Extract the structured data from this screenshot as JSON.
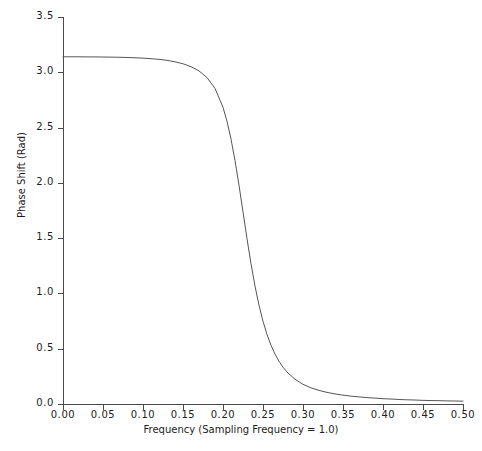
{
  "chart_data": {
    "type": "line",
    "title": "",
    "xlabel": "Frequency (Sampling Frequency = 1.0)",
    "ylabel": "Phase Shift (Rad)",
    "xlim": [
      0.0,
      0.5
    ],
    "ylim": [
      0.0,
      3.5
    ],
    "grid": false,
    "legend": "none",
    "xticks": [
      "0.00",
      "0.05",
      "0.10",
      "0.15",
      "0.20",
      "0.25",
      "0.30",
      "0.35",
      "0.40",
      "0.45",
      "0.50"
    ],
    "xtick_values": [
      0.0,
      0.05,
      0.1,
      0.15,
      0.2,
      0.25,
      0.3,
      0.35,
      0.4,
      0.45,
      0.5
    ],
    "yticks": [
      "0.0",
      "0.5",
      "1.0",
      "1.5",
      "2.0",
      "2.5",
      "3.0",
      "3.5"
    ],
    "ytick_values": [
      0.0,
      0.5,
      1.0,
      1.5,
      2.0,
      2.5,
      3.0,
      3.5
    ],
    "series": [
      {
        "name": "Phase Shift",
        "color": "#555555",
        "linewidth": 1,
        "x": [
          0.0,
          0.01,
          0.02,
          0.03,
          0.04,
          0.05,
          0.06,
          0.07,
          0.08,
          0.09,
          0.1,
          0.11,
          0.12,
          0.13,
          0.14,
          0.15,
          0.16,
          0.17,
          0.18,
          0.19,
          0.2,
          0.205,
          0.21,
          0.215,
          0.22,
          0.225,
          0.23,
          0.235,
          0.24,
          0.245,
          0.25,
          0.255,
          0.26,
          0.265,
          0.27,
          0.275,
          0.28,
          0.29,
          0.3,
          0.31,
          0.32,
          0.33,
          0.34,
          0.35,
          0.36,
          0.37,
          0.38,
          0.39,
          0.4,
          0.41,
          0.42,
          0.43,
          0.44,
          0.45,
          0.46,
          0.47,
          0.48,
          0.49,
          0.5
        ],
        "y": [
          3.14,
          3.14,
          3.14,
          3.139,
          3.139,
          3.138,
          3.137,
          3.136,
          3.134,
          3.131,
          3.128,
          3.123,
          3.117,
          3.108,
          3.095,
          3.077,
          3.051,
          3.012,
          2.952,
          2.854,
          2.684,
          2.556,
          2.396,
          2.202,
          1.978,
          1.737,
          1.495,
          1.268,
          1.066,
          0.893,
          0.748,
          0.629,
          0.531,
          0.451,
          0.386,
          0.333,
          0.289,
          0.223,
          0.178,
          0.146,
          0.123,
          0.105,
          0.091,
          0.08,
          0.071,
          0.064,
          0.058,
          0.053,
          0.048,
          0.045,
          0.041,
          0.038,
          0.036,
          0.033,
          0.031,
          0.03,
          0.028,
          0.027,
          0.026
        ]
      }
    ],
    "annotations": []
  },
  "axis": {
    "color": "#4a4a4a"
  }
}
